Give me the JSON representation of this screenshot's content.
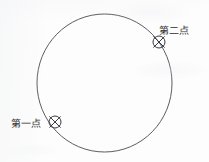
{
  "figure": {
    "title": "",
    "background_color": "#fdfdfd",
    "stroke_color": "#4a4a52",
    "text_color": "#2e2e2e",
    "circle": {
      "center_x": 104.5,
      "center_y": 83,
      "radius_x": 67.5,
      "radius_y": 69,
      "stroke_width": 0.9
    },
    "points": [
      {
        "id": "first-point",
        "label": "第一点",
        "marker": "x-in-circle-snap-marker",
        "marker_x": 55,
        "marker_y": 122,
        "marker_radius": 6,
        "label_x": 11,
        "label_y": 119
      },
      {
        "id": "second-point",
        "label": "第二点",
        "marker": "x-in-circle-snap-marker",
        "marker_x": 159,
        "marker_y": 42,
        "marker_radius": 6,
        "label_x": 159,
        "label_y": 26
      }
    ]
  }
}
